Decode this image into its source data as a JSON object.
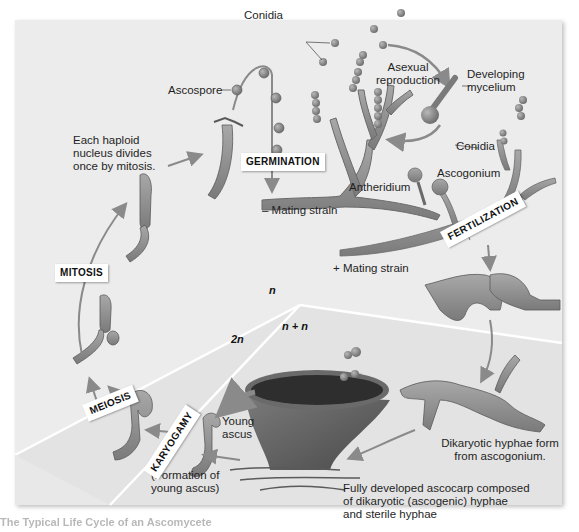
{
  "figure": {
    "title": "Life cycle of an ascomycete",
    "colors": {
      "panel_background": "#ececec",
      "panel_2n_region": "#e2e2e2",
      "hyphae_fill": "#8f8f8f",
      "hyphae_outline": "#5a5a5a",
      "nucleus": "#3a3a3a",
      "arrow": "#8a8a8a",
      "tag_background": "#ffffff"
    },
    "labels": {
      "conidia_top": "Conidia",
      "asexual_reproduction_line1": "Asexual",
      "asexual_reproduction_line2": "reproduction",
      "developing_mycelium_line1": "Developing",
      "developing_mycelium_line2": "mycelium",
      "ascospore": "Ascospore",
      "haploid_line1": "Each haploid",
      "haploid_line2": "nucleus divides",
      "haploid_line3": "once by mitosis.",
      "conidia_right": "Conidia",
      "ascogonium": "Ascogonium",
      "antheridium": "Antheridium",
      "minus_mating_strain": "– Mating strain",
      "plus_mating_strain": "+ Mating strain",
      "young_ascus_line1": "Young",
      "young_ascus_line2": "ascus",
      "formation_line1": "(Formation of",
      "formation_line2": "young ascus)",
      "dikaryotic_line1": "Dikaryotic hyphae form",
      "dikaryotic_line2": "from ascogonium.",
      "ascocarp_line1": "Fully developed ascocarp composed",
      "ascocarp_line2": "of dikaryotic (ascogenic) hyphae",
      "ascocarp_line3": "and sterile hyphae"
    },
    "stage_tags": {
      "germination": "GERMINATION",
      "fertilization": "FERTILIZATION",
      "mitosis": "MITOSIS",
      "meiosis": "MEIOSIS",
      "karyogamy": "KARYOGAMY"
    },
    "ploidy": {
      "haploid": "n",
      "dikaryotic": "n + n",
      "diploid": "2n"
    },
    "caption": "The Typical Life Cycle of an Ascomycete"
  }
}
